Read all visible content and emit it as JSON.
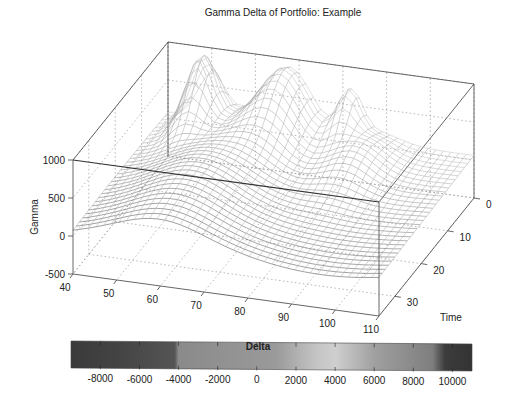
{
  "chart_data": {
    "type": "surface3d",
    "title": "Gamma Delta of Portfolio: Example",
    "xlabel": "",
    "ylabel": "Time",
    "zlabel": "Gamma",
    "colorbar_label": "Delta",
    "x_axis": {
      "name": "Strike/Price",
      "range": [
        40,
        110
      ],
      "ticks": [
        40,
        50,
        60,
        70,
        80,
        90,
        100,
        110
      ]
    },
    "y_axis": {
      "name": "Time",
      "range": [
        0,
        36
      ],
      "ticks": [
        0,
        10,
        20,
        30
      ]
    },
    "z_axis": {
      "name": "Gamma",
      "range": [
        -500,
        1000
      ],
      "ticks": [
        -500,
        0,
        500,
        1000
      ]
    },
    "colorbar": {
      "range": [
        -9500,
        11000
      ],
      "ticks": [
        -8000,
        -6000,
        -4000,
        -2000,
        0,
        2000,
        4000,
        6000,
        8000,
        10000
      ],
      "colormap": "gray",
      "stops": [
        {
          "v": -9500,
          "color": "#3a3a3a"
        },
        {
          "v": -7000,
          "color": "#444444"
        },
        {
          "v": -4200,
          "color": "#555555"
        },
        {
          "v": -4000,
          "color": "#8a8a8a"
        },
        {
          "v": 1000,
          "color": "#9a9a9a"
        },
        {
          "v": 3000,
          "color": "#c4c4c4"
        },
        {
          "v": 4000,
          "color": "#cfcfcf"
        },
        {
          "v": 6000,
          "color": "#a0a0a0"
        },
        {
          "v": 9000,
          "color": "#7e7e7e"
        },
        {
          "v": 9600,
          "color": "#3c3c3c"
        },
        {
          "v": 11000,
          "color": "#333333"
        }
      ]
    },
    "surface": {
      "description": "Wire-mesh gamma surface; sharp peaks near strike ~48-52 at short time, broad ridges around strikes 60-75 and 85-90 at long time, flattening toward 110",
      "peaks": [
        {
          "x": 50,
          "t": 4,
          "height": 900,
          "sx": 3.0,
          "st": 4.0
        },
        {
          "x": 68,
          "t": 2,
          "height": 780,
          "sx": 5.0,
          "st": 6.0
        },
        {
          "x": 82,
          "t": 1,
          "height": 600,
          "sx": 2.5,
          "st": 3.0
        },
        {
          "x": 88,
          "t": 8,
          "height": 330,
          "sx": 5.0,
          "st": 6.0
        },
        {
          "x": 60,
          "t": 20,
          "height": 380,
          "sx": 9.0,
          "st": 14.0
        }
      ],
      "baseline": 60,
      "grid_x": 40,
      "grid_t": 30
    },
    "grid": true,
    "view": "3d-perspective, azimuth ~ -37, elevation ~ 30"
  },
  "labels": {
    "title": "Gamma Delta of Portfolio: Example",
    "z_label": "Gamma",
    "y_label": "Time",
    "colorbar_label": "Delta"
  }
}
